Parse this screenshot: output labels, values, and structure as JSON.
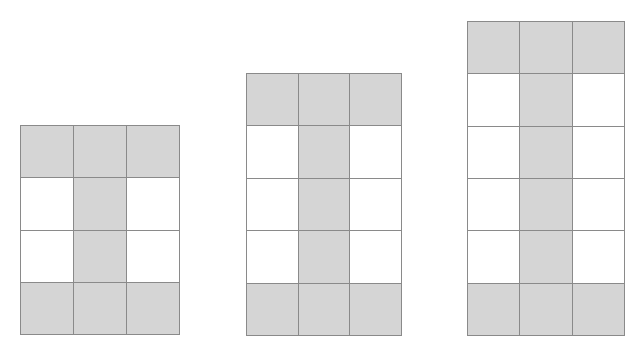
{
  "figures": [
    {
      "name": "figure-1",
      "x": 20,
      "y": 125,
      "width": 160,
      "height": 210,
      "cols": 3,
      "rows": 4,
      "pattern": [
        [
          1,
          1,
          1
        ],
        [
          0,
          1,
          0
        ],
        [
          0,
          1,
          0
        ],
        [
          1,
          1,
          1
        ]
      ]
    },
    {
      "name": "figure-2",
      "x": 246,
      "y": 73,
      "width": 156,
      "height": 263,
      "cols": 3,
      "rows": 5,
      "pattern": [
        [
          1,
          1,
          1
        ],
        [
          0,
          1,
          0
        ],
        [
          0,
          1,
          0
        ],
        [
          0,
          1,
          0
        ],
        [
          1,
          1,
          1
        ]
      ]
    },
    {
      "name": "figure-3",
      "x": 467,
      "y": 21,
      "width": 158,
      "height": 315,
      "cols": 3,
      "rows": 6,
      "pattern": [
        [
          1,
          1,
          1
        ],
        [
          0,
          1,
          0
        ],
        [
          0,
          1,
          0
        ],
        [
          0,
          1,
          0
        ],
        [
          0,
          1,
          0
        ],
        [
          1,
          1,
          1
        ]
      ]
    }
  ],
  "colors": {
    "shaded": "#d5d5d5",
    "unshaded": "#ffffff",
    "border": "#8a8a8a"
  }
}
